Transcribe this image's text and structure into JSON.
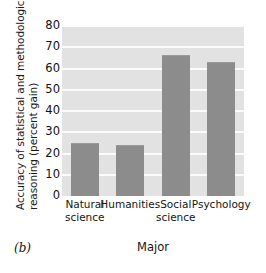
{
  "panel": {
    "label": "(b)"
  },
  "chart_data": {
    "type": "bar",
    "title": "",
    "subtitle": "",
    "xlabel": "Major",
    "ylabel": "Accuracy of statistical and methodological reasoning (percent gain)",
    "ylabel_lines": [
      "Accuracy of statistical and methodological",
      "reasoning (percent gain)"
    ],
    "categories": [
      "Natural science",
      "Humanities",
      "Social science",
      "Psychology"
    ],
    "category_lines": [
      [
        "Natural",
        "science"
      ],
      [
        "Humanities",
        ""
      ],
      [
        "Social",
        "science"
      ],
      [
        "Psychology",
        ""
      ]
    ],
    "values": [
      25,
      24,
      66.5,
      63
    ],
    "ylim": [
      0,
      80
    ],
    "yticks": [
      0,
      10,
      20,
      30,
      40,
      50,
      60,
      70,
      80
    ],
    "ytick_labels": [
      "0",
      "10",
      "20",
      "30",
      "40",
      "50",
      "60",
      "70",
      "80"
    ],
    "grid": true,
    "grid_axis": "y",
    "legend": "none",
    "colors": {
      "bar_fill": "#8c8c8c",
      "plot_background": "#e2e2e2",
      "gridline": "#fbfbfb",
      "text": "#111111",
      "figure_background": "#ffffff"
    }
  }
}
